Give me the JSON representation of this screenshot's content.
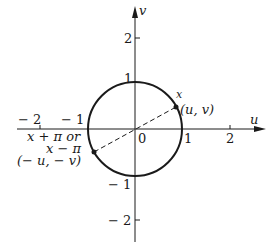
{
  "diagram": {
    "type": "unit-circle",
    "axes": {
      "horizontal_label": "u",
      "vertical_label": "v",
      "origin_label": "0"
    },
    "u_ticks": [
      {
        "value": -2,
        "label": "− 2"
      },
      {
        "value": -1,
        "label": "− 1"
      },
      {
        "value": 1,
        "label": "1"
      },
      {
        "value": 2,
        "label": "2"
      }
    ],
    "v_ticks": [
      {
        "value": 2,
        "label": "2"
      },
      {
        "value": 1,
        "label": "1"
      },
      {
        "value": -1,
        "label": "− 1"
      },
      {
        "value": -2,
        "label": "− 2"
      }
    ],
    "points": {
      "p1": {
        "angle_label": "x",
        "coord_label": "(u, v)"
      },
      "p2": {
        "angle_label_line1": "x + π or",
        "angle_label_line2": "x − π",
        "coord_label": "(− u, − v)"
      }
    },
    "colors": {
      "ink": "#1a1a1a",
      "background": "#ffffff"
    }
  }
}
